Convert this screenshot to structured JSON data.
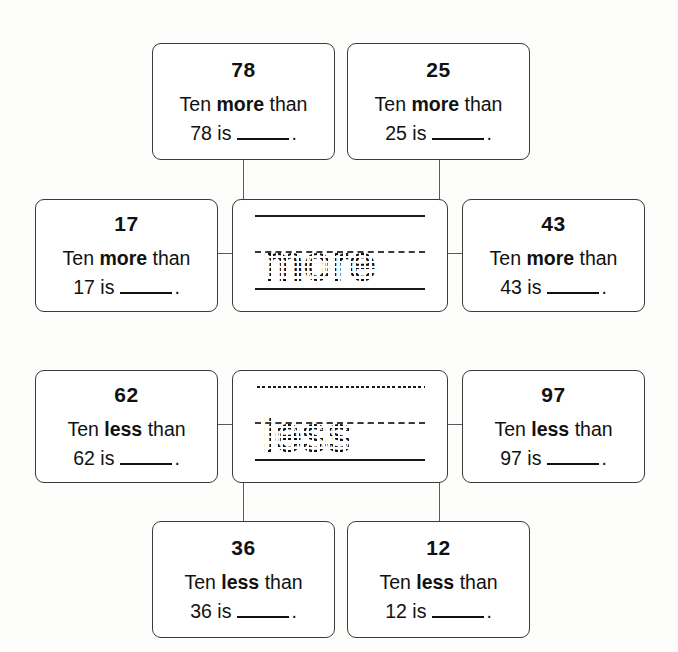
{
  "worksheet": {
    "background_color": "#fdfdfb",
    "ink_color": "#111111",
    "groups": [
      {
        "id": "more-group",
        "keyword": "more",
        "center_trace_word": "more",
        "cards": [
          {
            "position": "top-left",
            "number": "78",
            "line1_prefix": "Ten ",
            "line1_keyword": "more",
            "line1_suffix": " than",
            "line2_prefix": "78 is",
            "line2_suffix": "."
          },
          {
            "position": "top-right",
            "number": "25",
            "line1_prefix": "Ten ",
            "line1_keyword": "more",
            "line1_suffix": " than",
            "line2_prefix": "25 is",
            "line2_suffix": "."
          },
          {
            "position": "middle-left",
            "number": "17",
            "line1_prefix": "Ten ",
            "line1_keyword": "more",
            "line1_suffix": " than",
            "line2_prefix": "17 is",
            "line2_suffix": "."
          },
          {
            "position": "middle-right",
            "number": "43",
            "line1_prefix": "Ten ",
            "line1_keyword": "more",
            "line1_suffix": " than",
            "line2_prefix": "43 is",
            "line2_suffix": "."
          }
        ]
      },
      {
        "id": "less-group",
        "keyword": "less",
        "center_trace_word": "less",
        "cards": [
          {
            "position": "middle-left",
            "number": "62",
            "line1_prefix": "Ten ",
            "line1_keyword": "less",
            "line1_suffix": " than",
            "line2_prefix": "62 is",
            "line2_suffix": "."
          },
          {
            "position": "middle-right",
            "number": "97",
            "line1_prefix": "Ten ",
            "line1_keyword": "less",
            "line1_suffix": " than",
            "line2_prefix": "97 is",
            "line2_suffix": "."
          },
          {
            "position": "bottom-left",
            "number": "36",
            "line1_prefix": "Ten ",
            "line1_keyword": "less",
            "line1_suffix": " than",
            "line2_prefix": "36 is",
            "line2_suffix": "."
          },
          {
            "position": "bottom-right",
            "number": "12",
            "line1_prefix": "Ten ",
            "line1_keyword": "less",
            "line1_suffix": " than",
            "line2_prefix": "12 is",
            "line2_suffix": "."
          }
        ]
      }
    ]
  }
}
